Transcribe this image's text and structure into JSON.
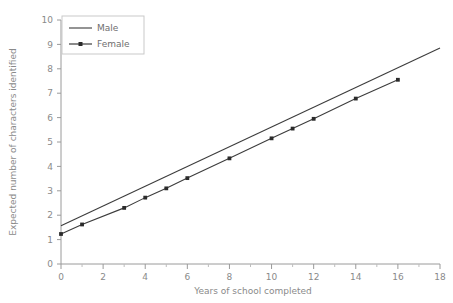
{
  "chart_data": {
    "type": "line",
    "title": "",
    "xlabel": "Years of school completed",
    "ylabel": "Expected number of characters identified",
    "xlim": [
      0,
      18
    ],
    "ylim": [
      0,
      10
    ],
    "x_ticks": [
      0,
      2,
      4,
      6,
      8,
      10,
      12,
      14,
      16,
      18
    ],
    "x_tick_labels": [
      "0",
      "2",
      "4",
      "6",
      "8",
      "10",
      "12",
      "14",
      "16",
      "18"
    ],
    "x_minor_ticks": [
      1,
      3,
      5,
      7,
      9,
      11,
      13,
      15,
      17
    ],
    "y_ticks": [
      0,
      1,
      2,
      3,
      4,
      5,
      6,
      7,
      8,
      9,
      10
    ],
    "y_tick_labels": [
      "0",
      "1",
      "2",
      "3",
      "4",
      "5",
      "6",
      "7",
      "8",
      "9",
      "10"
    ],
    "grid": false,
    "legend_position": "top-left",
    "series": [
      {
        "name": "Male",
        "marker": "none",
        "color": "#3c3c3c",
        "x": [
          0,
          18
        ],
        "values": [
          1.57,
          8.85
        ]
      },
      {
        "name": "Female",
        "marker": "square",
        "color": "#2b2b2b",
        "x": [
          0,
          1,
          3,
          4,
          5,
          6,
          8,
          10,
          11,
          12,
          14,
          16
        ],
        "values": [
          1.23,
          1.62,
          2.3,
          2.72,
          3.1,
          3.52,
          4.33,
          5.15,
          5.55,
          5.95,
          6.78,
          7.55
        ]
      }
    ]
  },
  "legend": {
    "items": [
      {
        "label": "Male"
      },
      {
        "label": "Female"
      }
    ]
  },
  "axes": {
    "x_title": "Years of school completed",
    "y_title": "Expected number of characters identified"
  },
  "colors": {
    "axis": "#9a9a9a",
    "text": "#8a8a8a",
    "series_male": "#3c3c3c",
    "series_female": "#2b2b2b",
    "background": "#ffffff"
  }
}
